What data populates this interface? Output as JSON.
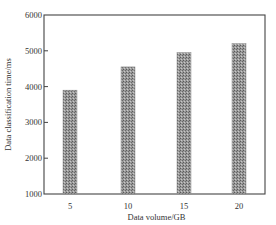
{
  "chart_data": {
    "type": "bar",
    "title": "",
    "xlabel": "Data volume/GB",
    "ylabel": "Data classification time/ms",
    "categories": [
      "5",
      "10",
      "15",
      "20"
    ],
    "values": [
      3900,
      4550,
      4950,
      5200
    ],
    "ylim": [
      1000,
      6000
    ],
    "yticks": [
      1000,
      2000,
      3000,
      4000,
      5000,
      6000
    ],
    "grid": false,
    "legend": null,
    "bar_fill": "#8a8a8a",
    "bar_pattern": "dotted-halftone"
  }
}
